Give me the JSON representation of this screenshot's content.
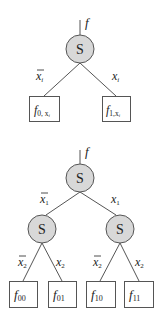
{
  "colors": {
    "node_fill": "#d8d8d8",
    "stroke": "#555555",
    "text": "#222222",
    "background": "#ffffff"
  },
  "diagram_top": {
    "title": "Shannon expansion single level",
    "output_label": "f",
    "root": {
      "label": "S"
    },
    "edges": [
      {
        "label_base": "x",
        "label_sub": "i",
        "negated": true
      },
      {
        "label_base": "x",
        "label_sub": "i",
        "negated": false
      }
    ],
    "leaves": [
      {
        "base": "f",
        "sub": "0, x",
        "subsub": "i"
      },
      {
        "base": "f",
        "sub": "1,x",
        "subsub": "i"
      }
    ]
  },
  "diagram_bottom": {
    "title": "Shannon expansion two levels",
    "output_label": "f",
    "root": {
      "label": "S"
    },
    "edges_level1": [
      {
        "label_base": "x",
        "label_sub": "1",
        "negated": true
      },
      {
        "label_base": "x",
        "label_sub": "1",
        "negated": false
      }
    ],
    "mid_nodes": [
      {
        "label": "S"
      },
      {
        "label": "S"
      }
    ],
    "edges_level2": [
      {
        "label_base": "x",
        "label_sub": "2",
        "negated": true
      },
      {
        "label_base": "x",
        "label_sub": "2",
        "negated": false
      },
      {
        "label_base": "x",
        "label_sub": "2",
        "negated": true
      },
      {
        "label_base": "x",
        "label_sub": "2",
        "negated": false
      }
    ],
    "leaves": [
      {
        "base": "f",
        "sub": "00"
      },
      {
        "base": "f",
        "sub": "01"
      },
      {
        "base": "f",
        "sub": "10"
      },
      {
        "base": "f",
        "sub": "11"
      }
    ]
  }
}
